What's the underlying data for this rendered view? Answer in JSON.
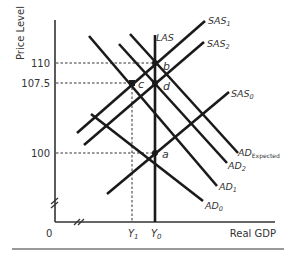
{
  "axes": {
    "y_label": "Price Level",
    "x_label": "Real GDP",
    "origin": "0",
    "y_ticks": [
      {
        "label": "110",
        "value": 110
      },
      {
        "label": "107.5",
        "value": 107.5
      },
      {
        "label": "100",
        "value": 100
      }
    ],
    "x_ticks": [
      {
        "label": "Y",
        "sub": "1"
      },
      {
        "label": "Y",
        "sub": "0"
      }
    ]
  },
  "curves": {
    "las": "LAS",
    "sas1": {
      "main": "SAS",
      "sub": "1"
    },
    "sas2": {
      "main": "SAS",
      "sub": "2"
    },
    "sas0": {
      "main": "SAS",
      "sub": "0"
    },
    "ad_expected": {
      "main": "AD",
      "sub": "Expected"
    },
    "ad2": {
      "main": "AD",
      "sub": "2"
    },
    "ad1": {
      "main": "AD",
      "sub": "1"
    },
    "ad0": {
      "main": "AD",
      "sub": "0"
    }
  },
  "points": {
    "a": "a",
    "b": "b",
    "c": "c",
    "d": "d"
  },
  "colors": {
    "line": "#1a1a1a",
    "text": "#333333",
    "rule": "#999999"
  }
}
